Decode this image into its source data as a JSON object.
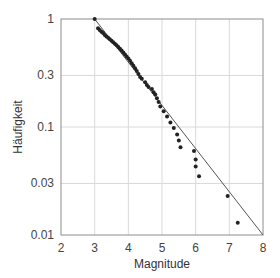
{
  "chart_data": {
    "type": "scatter",
    "title": "",
    "xlabel": "Magnitude",
    "ylabel": "Häufigkeit",
    "xlim": [
      2,
      8
    ],
    "ylim": [
      0.01,
      1
    ],
    "yscale": "log",
    "grid": true,
    "legend": null,
    "x_ticks": [
      "2",
      "3",
      "4",
      "5",
      "6",
      "7",
      "8"
    ],
    "y_ticks": [
      "1",
      "0.3",
      "0.1",
      "0.03",
      "0.01"
    ],
    "y_tick_values": [
      1,
      0.3,
      0.1,
      0.03,
      0.01
    ],
    "x_tick_values": [
      2,
      3,
      4,
      5,
      6,
      7,
      8
    ],
    "series": [
      {
        "name": "observed",
        "kind": "points",
        "color": "#222222",
        "points": [
          [
            3.0,
            1.0
          ],
          [
            3.1,
            0.82
          ],
          [
            3.15,
            0.79
          ],
          [
            3.2,
            0.76
          ],
          [
            3.25,
            0.74
          ],
          [
            3.3,
            0.71
          ],
          [
            3.35,
            0.69
          ],
          [
            3.4,
            0.67
          ],
          [
            3.45,
            0.65
          ],
          [
            3.5,
            0.63
          ],
          [
            3.55,
            0.61
          ],
          [
            3.6,
            0.59
          ],
          [
            3.65,
            0.57
          ],
          [
            3.7,
            0.55
          ],
          [
            3.75,
            0.53
          ],
          [
            3.8,
            0.51
          ],
          [
            3.85,
            0.49
          ],
          [
            3.9,
            0.47
          ],
          [
            3.95,
            0.45
          ],
          [
            4.0,
            0.43
          ],
          [
            4.05,
            0.41
          ],
          [
            4.1,
            0.39
          ],
          [
            4.15,
            0.37
          ],
          [
            4.2,
            0.35
          ],
          [
            4.25,
            0.33
          ],
          [
            4.3,
            0.31
          ],
          [
            4.35,
            0.29
          ],
          [
            4.4,
            0.28
          ],
          [
            4.5,
            0.26
          ],
          [
            4.55,
            0.245
          ],
          [
            4.6,
            0.235
          ],
          [
            4.7,
            0.225
          ],
          [
            4.75,
            0.21
          ],
          [
            4.8,
            0.2
          ],
          [
            4.85,
            0.185
          ],
          [
            4.9,
            0.17
          ],
          [
            4.95,
            0.155
          ],
          [
            5.05,
            0.14
          ],
          [
            5.15,
            0.125
          ],
          [
            5.25,
            0.11
          ],
          [
            5.35,
            0.098
          ],
          [
            5.45,
            0.085
          ],
          [
            5.5,
            0.075
          ],
          [
            5.55,
            0.065
          ],
          [
            5.95,
            0.06
          ],
          [
            6.0,
            0.05
          ],
          [
            6.0,
            0.043
          ],
          [
            6.1,
            0.035
          ],
          [
            6.95,
            0.023
          ],
          [
            7.25,
            0.013
          ]
        ]
      },
      {
        "name": "fit",
        "kind": "line",
        "color": "#555555",
        "points": [
          [
            3.0,
            1.0
          ],
          [
            8.0,
            0.01
          ]
        ]
      }
    ]
  },
  "colors": {
    "background": "#ffffff",
    "grid": "#d9d9d9",
    "frame": "#8c8c8c",
    "points": "#222222",
    "fit_line": "#555555"
  }
}
